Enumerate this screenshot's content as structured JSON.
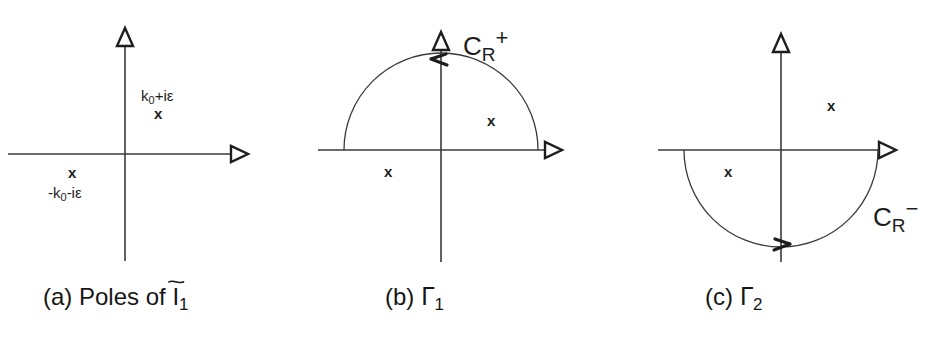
{
  "figure": {
    "width": 948,
    "height": 354,
    "background": "#ffffff",
    "stroke_color": "#333333",
    "text_color": "#1d1d1d"
  },
  "panels": [
    {
      "id": "a",
      "caption_prefix": "(a)",
      "caption_text": "Poles of",
      "caption_symbol": "I",
      "caption_symbol_accent": "~",
      "caption_symbol_sub": "1",
      "axes": {
        "x_arrow": "right",
        "y_arrow": "up"
      },
      "poles": [
        {
          "name": "pole-upper-right",
          "marker": "x",
          "label_base": "k",
          "label_sub": "0",
          "label_tail": "+iε"
        },
        {
          "name": "pole-lower-left",
          "marker": "x",
          "label_base": "-k",
          "label_sub": "0",
          "label_tail": "-iε"
        }
      ]
    },
    {
      "id": "b",
      "caption_prefix": "(b)",
      "caption_symbol": "Γ",
      "caption_symbol_sub": "1",
      "contour_label_base": "C",
      "contour_label_sub": "R",
      "contour_label_sup": "+",
      "contour_half": "upper",
      "contour_direction": "counterclockwise",
      "arrow_position": "top",
      "arrow_direction": "left",
      "axes": {
        "x_arrow": "right",
        "y_arrow": "up"
      },
      "pole_markers": [
        "x",
        "x"
      ]
    },
    {
      "id": "c",
      "caption_prefix": "(c)",
      "caption_symbol": "Γ",
      "caption_symbol_sub": "2",
      "contour_label_base": "C",
      "contour_label_sub": "R",
      "contour_label_sup": "−",
      "contour_half": "lower",
      "contour_direction": "clockwise",
      "arrow_position": "bottom",
      "arrow_direction": "right",
      "axes": {
        "x_arrow": "right",
        "y_arrow": "up"
      },
      "pole_markers": [
        "x",
        "x"
      ]
    }
  ]
}
